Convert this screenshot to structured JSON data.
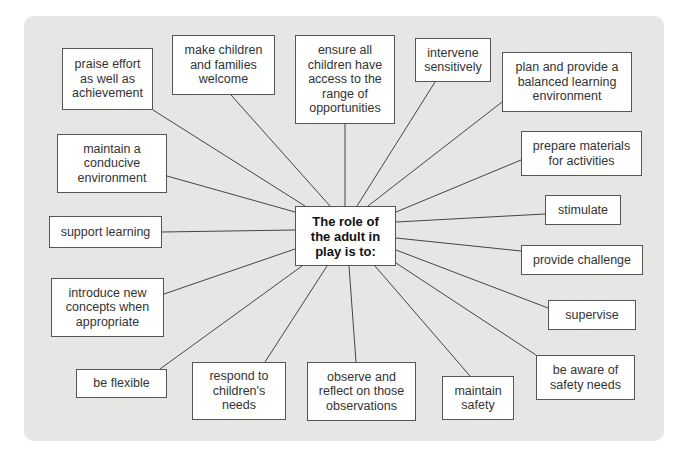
{
  "diagram": {
    "type": "spider-diagram",
    "center": {
      "label": "The role of\nthe adult in\nplay is to:",
      "box": [
        295,
        206,
        101,
        60
      ]
    },
    "nodes": [
      {
        "id": "praise",
        "label": "praise effort\nas well as\nachievement",
        "box": [
          62,
          48,
          91,
          62
        ],
        "anchor": [
          153,
          110
        ]
      },
      {
        "id": "welcome",
        "label": "make children\nand families\nwelcome",
        "box": [
          172,
          35,
          103,
          60
        ],
        "anchor": [
          231,
          95
        ]
      },
      {
        "id": "ensure",
        "label": "ensure all\nchildren have\naccess to the\nrange of\nopportunities",
        "box": [
          295,
          35,
          100,
          89
        ],
        "anchor": [
          345,
          124
        ]
      },
      {
        "id": "intervene",
        "label": "intervene\nsensitively",
        "box": [
          415,
          38,
          76,
          44
        ],
        "anchor": [
          435,
          82
        ]
      },
      {
        "id": "plan",
        "label": "plan and provide a\nbalanced learning\nenvironment",
        "box": [
          502,
          52,
          130,
          60
        ],
        "anchor": [
          502,
          102
        ]
      },
      {
        "id": "maintain-env",
        "label": "maintain a\nconducive\nenvironment",
        "box": [
          57,
          134,
          110,
          59
        ],
        "anchor": [
          167,
          176
        ]
      },
      {
        "id": "prepare",
        "label": "prepare materials\nfor activities",
        "box": [
          521,
          131,
          121,
          45
        ],
        "anchor": [
          521,
          160
        ]
      },
      {
        "id": "support",
        "label": "support learning",
        "box": [
          49,
          216,
          113,
          32
        ],
        "anchor": [
          162,
          232
        ]
      },
      {
        "id": "stimulate",
        "label": "stimulate",
        "box": [
          545,
          195,
          76,
          30
        ],
        "anchor": [
          545,
          214
        ]
      },
      {
        "id": "challenge",
        "label": "provide challenge",
        "box": [
          521,
          245,
          122,
          30
        ],
        "anchor": [
          521,
          251
        ]
      },
      {
        "id": "introduce",
        "label": "introduce new\nconcepts when\nappropriate",
        "box": [
          51,
          278,
          113,
          59
        ],
        "anchor": [
          164,
          294
        ]
      },
      {
        "id": "supervise",
        "label": "supervise",
        "box": [
          548,
          300,
          88,
          30
        ],
        "anchor": [
          548,
          308
        ]
      },
      {
        "id": "flexible",
        "label": "be flexible",
        "box": [
          76,
          369,
          91,
          29
        ],
        "anchor": [
          160,
          369
        ]
      },
      {
        "id": "respond",
        "label": "respond to\nchildren's\nneeds",
        "box": [
          192,
          362,
          94,
          58
        ],
        "anchor": [
          265,
          362
        ]
      },
      {
        "id": "observe",
        "label": "observe and\nreflect on those\nobservations",
        "box": [
          307,
          362,
          109,
          59
        ],
        "anchor": [
          356,
          362
        ]
      },
      {
        "id": "safety",
        "label": "maintain\nsafety",
        "box": [
          442,
          376,
          72,
          44
        ],
        "anchor": [
          470,
          376
        ]
      },
      {
        "id": "aware",
        "label": "be aware of\nsafety needs",
        "box": [
          536,
          355,
          99,
          45
        ],
        "anchor": [
          536,
          355
        ]
      }
    ],
    "edges_to_center": [
      {
        "from": "praise",
        "to": [
          305,
          206
        ]
      },
      {
        "from": "welcome",
        "to": [
          330,
          206
        ]
      },
      {
        "from": "ensure",
        "to": [
          345,
          206
        ]
      },
      {
        "from": "intervene",
        "to": [
          357,
          206
        ]
      },
      {
        "from": "plan",
        "to": [
          368,
          206
        ]
      },
      {
        "from": "maintain-env",
        "to": [
          295,
          212
        ]
      },
      {
        "from": "prepare",
        "to": [
          396,
          212
        ]
      },
      {
        "from": "support",
        "to": [
          295,
          230
        ]
      },
      {
        "from": "stimulate",
        "to": [
          396,
          222
        ]
      },
      {
        "from": "challenge",
        "to": [
          396,
          238
        ]
      },
      {
        "from": "introduce",
        "to": [
          295,
          249
        ]
      },
      {
        "from": "supervise",
        "to": [
          396,
          250
        ]
      },
      {
        "from": "flexible",
        "to": [
          302,
          266
        ]
      },
      {
        "from": "respond",
        "to": [
          327,
          266
        ]
      },
      {
        "from": "observe",
        "to": [
          349,
          266
        ]
      },
      {
        "from": "safety",
        "to": [
          375,
          266
        ]
      },
      {
        "from": "aware",
        "to": [
          396,
          263
        ]
      }
    ]
  },
  "colors": {
    "panel": "#e6e6e5",
    "box_fill": "#ffffff",
    "box_border": "#555555",
    "line": "#444444",
    "text": "#333333"
  }
}
